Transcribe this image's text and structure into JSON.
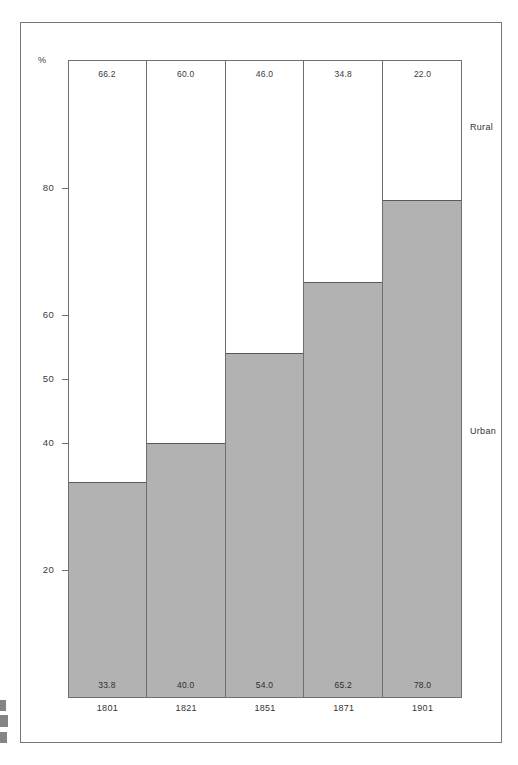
{
  "figure": {
    "percent_symbol": "%",
    "series_labels": {
      "upper": "Rural",
      "lower": "Urban"
    }
  },
  "chart_data": {
    "type": "bar",
    "subtype": "stacked-percentage",
    "title": "",
    "xlabel": "",
    "ylabel": "%",
    "categories": [
      "1801",
      "1821",
      "1851",
      "1871",
      "1901"
    ],
    "ylim": [
      0,
      100
    ],
    "yticks": [
      20,
      40,
      50,
      60,
      80
    ],
    "ytick_labels": [
      "20",
      "40",
      "50",
      "60",
      "80"
    ],
    "grid": false,
    "legend_position": "right-inline",
    "series": [
      {
        "name": "Urban",
        "values": [
          33.8,
          40.0,
          54.0,
          65.2,
          78.0
        ],
        "labels": [
          "33.8",
          "40.0",
          "54.0",
          "65.2",
          "78.0"
        ],
        "color": "#b2b2b2"
      },
      {
        "name": "Rural",
        "values": [
          66.2,
          60.0,
          46.0,
          34.8,
          22.0
        ],
        "labels": [
          "66.2",
          "60.0",
          "46.0",
          "34.8",
          "22.0"
        ],
        "color": "#ffffff"
      }
    ]
  },
  "colors": {
    "urban_fill": "#b2b2b2",
    "rural_fill": "#ffffff",
    "axis": "#707070",
    "frame": "#777777",
    "text": "#3a3a3a"
  }
}
